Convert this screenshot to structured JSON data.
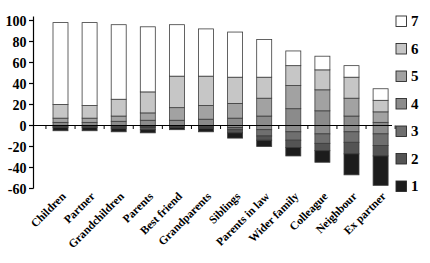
{
  "chart_data": {
    "type": "bar",
    "subtype": "diverging-stacked-likert",
    "title": "",
    "xlabel": "",
    "ylabel": "",
    "ylim": [
      -60,
      100
    ],
    "yticks": [
      100,
      80,
      60,
      40,
      20,
      0,
      -20,
      -40,
      -60
    ],
    "grid": false,
    "legend_position": "right",
    "legend_labels": [
      "7",
      "6",
      "5",
      "4",
      "3",
      "2",
      "1"
    ],
    "colors": {
      "7": "#ffffff",
      "6": "#c6c6c6",
      "5": "#a2a2a2",
      "4": "#8b8b8b",
      "3": "#6f6f6f",
      "2": "#545454",
      "1": "#1c1c1c"
    },
    "segment_stroke": "#3c3c3c",
    "axis_color": "#000000",
    "categories": [
      "Children",
      "Partner",
      "Grandchildren",
      "Parents",
      "Best friend",
      "Grandparents",
      "Siblings",
      "Parents in law",
      "Wider family",
      "Colleague",
      "Neighbour",
      "Ex partner"
    ],
    "stack_above_zero": [
      {
        "level": "4",
        "values": [
          3,
          3,
          4,
          5,
          5,
          6,
          7,
          9,
          16,
          14,
          9,
          3
        ]
      },
      {
        "level": "5",
        "values": [
          4,
          4,
          5,
          7,
          12,
          13,
          14,
          17,
          22,
          20,
          17,
          10
        ]
      },
      {
        "level": "6",
        "values": [
          13,
          12,
          16,
          20,
          30,
          28,
          25,
          20,
          19,
          19,
          20,
          11
        ]
      },
      {
        "level": "7",
        "values": [
          78,
          79,
          71,
          62,
          49,
          45,
          43,
          36,
          14,
          13,
          11,
          11
        ]
      }
    ],
    "stack_below_zero": [
      {
        "level": "4",
        "values": [
          0,
          0,
          1,
          1,
          0,
          1,
          2,
          4,
          6,
          8,
          6,
          8
        ]
      },
      {
        "level": "3",
        "values": [
          1,
          1,
          1,
          1,
          1,
          1,
          2,
          6,
          8,
          9,
          10,
          11
        ]
      },
      {
        "level": "2",
        "values": [
          1,
          1,
          1,
          2,
          1,
          1,
          3,
          4,
          7,
          7,
          11,
          10
        ]
      },
      {
        "level": "1",
        "values": [
          3,
          3,
          3,
          3,
          2,
          3,
          5,
          6,
          8,
          11,
          20,
          28
        ]
      }
    ],
    "totals_above": [
      98,
      98,
      96,
      94,
      96,
      92,
      89,
      82,
      71,
      66,
      57,
      35
    ],
    "totals_below": [
      -5,
      -5,
      -6,
      -7,
      -4,
      -6,
      -12,
      -20,
      -29,
      -35,
      -47,
      -57
    ]
  }
}
